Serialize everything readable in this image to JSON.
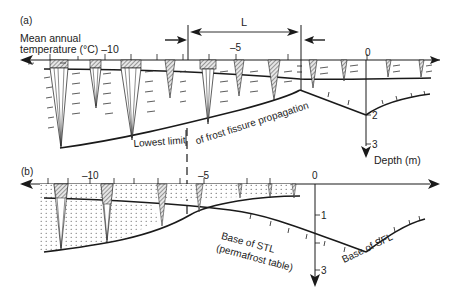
{
  "panel_a": {
    "label": "(a)",
    "axis_title_line1": "Mean annual",
    "axis_title_line2": "temperature (°C) –10",
    "tick_minus5": "–5",
    "tick_zero": "0",
    "dimension_label": "L",
    "depth_ticks": [
      "2",
      "3"
    ],
    "depth_axis_label": "Depth (m)",
    "boundary_label_left": "Lowest limit",
    "boundary_label_right": "of frost fissure  propagation"
  },
  "panel_b": {
    "label": "(b)",
    "tick_minus10": "–10",
    "tick_minus5": "–5",
    "tick_zero": "0",
    "depth_ticks": [
      "1",
      "3"
    ],
    "stl_label_line1": "Base of STL",
    "stl_label_line2": "(permafrost table)",
    "sfl_label": "Base of SFL"
  },
  "colors": {
    "line": "#1a1a1a",
    "hatch": "#555555",
    "background": "#ffffff"
  }
}
